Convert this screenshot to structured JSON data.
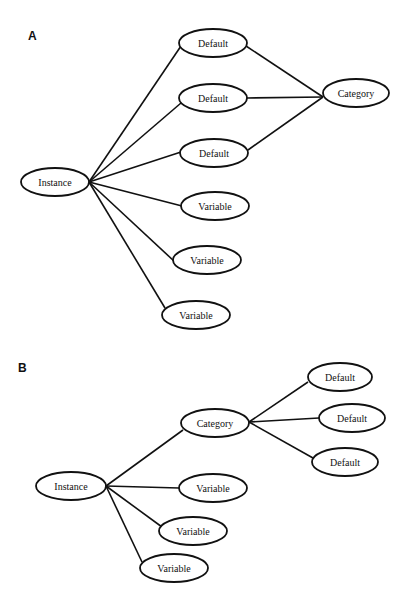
{
  "diagrams": [
    {
      "label": "A",
      "label_pos": [
        28,
        40
      ],
      "nodes": [
        {
          "id": "a_instance",
          "text": "Instance",
          "cx": 55,
          "cy": 182,
          "rx": 34,
          "ry": 14
        },
        {
          "id": "a_default1",
          "text": "Default",
          "cx": 213,
          "cy": 43,
          "rx": 34,
          "ry": 14
        },
        {
          "id": "a_default2",
          "text": "Default",
          "cx": 213,
          "cy": 98,
          "rx": 34,
          "ry": 14
        },
        {
          "id": "a_default3",
          "text": "Default",
          "cx": 214,
          "cy": 153,
          "rx": 34,
          "ry": 14
        },
        {
          "id": "a_category",
          "text": "Category",
          "cx": 356,
          "cy": 93,
          "rx": 33,
          "ry": 14
        },
        {
          "id": "a_variable1",
          "text": "Variable",
          "cx": 215,
          "cy": 206,
          "rx": 34,
          "ry": 14
        },
        {
          "id": "a_variable2",
          "text": "Variable",
          "cx": 207,
          "cy": 260,
          "rx": 34,
          "ry": 14
        },
        {
          "id": "a_variable3",
          "text": "Variable",
          "cx": 196,
          "cy": 315,
          "rx": 34,
          "ry": 14
        }
      ],
      "edges": [
        {
          "from": [
            89,
            182
          ],
          "to": [
            181,
            46
          ]
        },
        {
          "from": [
            89,
            182
          ],
          "to": [
            181,
            103
          ]
        },
        {
          "from": [
            89,
            182
          ],
          "to": [
            181,
            152
          ]
        },
        {
          "from": [
            89,
            182
          ],
          "to": [
            182,
            206
          ]
        },
        {
          "from": [
            89,
            182
          ],
          "to": [
            175,
            262
          ]
        },
        {
          "from": [
            89,
            182
          ],
          "to": [
            165,
            308
          ]
        },
        {
          "from": [
            246,
            46
          ],
          "to": [
            323,
            97
          ]
        },
        {
          "from": [
            247,
            98
          ],
          "to": [
            323,
            97
          ]
        },
        {
          "from": [
            248,
            150
          ],
          "to": [
            323,
            97
          ]
        }
      ]
    },
    {
      "label": "B",
      "label_pos": [
        18,
        372
      ],
      "nodes": [
        {
          "id": "b_instance",
          "text": "Instance",
          "cx": 71,
          "cy": 486,
          "rx": 35,
          "ry": 14
        },
        {
          "id": "b_category",
          "text": "Category",
          "cx": 215,
          "cy": 423,
          "rx": 34,
          "ry": 14
        },
        {
          "id": "b_default1",
          "text": "Default",
          "cx": 340,
          "cy": 377,
          "rx": 32,
          "ry": 14
        },
        {
          "id": "b_default2",
          "text": "Default",
          "cx": 352,
          "cy": 418,
          "rx": 33,
          "ry": 14
        },
        {
          "id": "b_default3",
          "text": "Default",
          "cx": 345,
          "cy": 462,
          "rx": 33,
          "ry": 14
        },
        {
          "id": "b_variable1",
          "text": "Variable",
          "cx": 213,
          "cy": 488,
          "rx": 34,
          "ry": 14
        },
        {
          "id": "b_variable2",
          "text": "Variable",
          "cx": 193,
          "cy": 531,
          "rx": 34,
          "ry": 14
        },
        {
          "id": "b_variable3",
          "text": "Variable",
          "cx": 174,
          "cy": 568,
          "rx": 34,
          "ry": 14
        }
      ],
      "edges": [
        {
          "from": [
            106,
            486
          ],
          "to": [
            183,
            430
          ]
        },
        {
          "from": [
            106,
            486
          ],
          "to": [
            179,
            488
          ]
        },
        {
          "from": [
            106,
            486
          ],
          "to": [
            162,
            527
          ]
        },
        {
          "from": [
            106,
            486
          ],
          "to": [
            142,
            562
          ]
        },
        {
          "from": [
            249,
            422
          ],
          "to": [
            308,
            382
          ]
        },
        {
          "from": [
            249,
            422
          ],
          "to": [
            319,
            418
          ]
        },
        {
          "from": [
            249,
            422
          ],
          "to": [
            313,
            458
          ]
        }
      ]
    }
  ]
}
